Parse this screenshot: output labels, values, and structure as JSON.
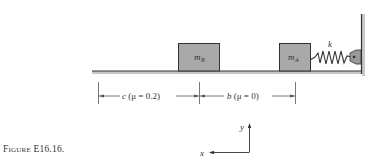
{
  "figure": {
    "caption_prefix": "Figure",
    "caption_number": "E16.16."
  },
  "blocks": {
    "b": {
      "label": "m",
      "subscript": "B"
    },
    "a": {
      "label": "m",
      "subscript": "A"
    }
  },
  "spring": {
    "label": "k"
  },
  "dimensions": {
    "c": {
      "var": "c",
      "text": " (μ = 0.2)"
    },
    "b": {
      "var": "b",
      "text": " (μ = 0)"
    }
  },
  "axes": {
    "x_label": "x",
    "y_label": "y"
  },
  "colors": {
    "block_fill": "#a9a9a9",
    "block_stroke": "#333333",
    "line": "#333333"
  }
}
